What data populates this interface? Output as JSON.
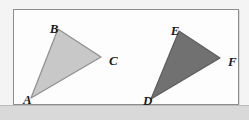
{
  "figure": {
    "caption_present": false,
    "background_color": "#f4f4f4",
    "box": {
      "border_color": "#8d8d8d",
      "fill_color": "#fdfdfd"
    },
    "shapes": [
      {
        "name": "triangle-abc",
        "type": "triangle",
        "fill_color": "#c8c8c8",
        "stroke_color": "#8f8f8f",
        "points": "44,19 87,47 17,88",
        "vertices": [
          {
            "label": "B",
            "x": 44,
            "y": 19,
            "label_x": 40,
            "label_y": 13
          },
          {
            "label": "C",
            "x": 87,
            "y": 47,
            "label_x": 95,
            "label_y": 52
          },
          {
            "label": "A",
            "x": 17,
            "y": 88,
            "label_x": 9,
            "label_y": 94
          }
        ]
      },
      {
        "name": "triangle-def",
        "type": "triangle",
        "fill_color": "#717171",
        "stroke_color": "#5d5d5d",
        "points": "165,21 206,48 137,89",
        "vertices": [
          {
            "label": "E",
            "x": 165,
            "y": 21,
            "label_x": 161,
            "label_y": 15
          },
          {
            "label": "F",
            "x": 206,
            "y": 48,
            "label_x": 214,
            "label_y": 53
          },
          {
            "label": "D",
            "x": 137,
            "y": 89,
            "label_x": 129,
            "label_y": 95
          }
        ]
      }
    ],
    "labels": {
      "b": "B",
      "c": "C",
      "a": "A",
      "e": "E",
      "f": "F",
      "d": "D"
    }
  }
}
